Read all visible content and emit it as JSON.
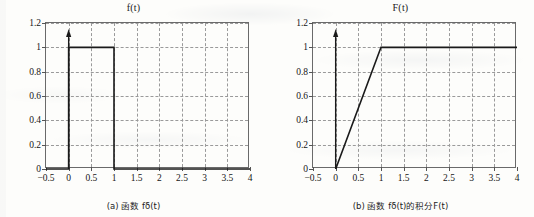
{
  "figure": {
    "background_color": "#fdfdfb",
    "axis_color": "#6a6a6a",
    "grid_color": "#9a9a9a",
    "curve_color": "#1a1a1a"
  },
  "panels": [
    {
      "id": "panel-a",
      "title": "f(t)",
      "caption_prefix": "(a)",
      "caption_cjk": "函数",
      "caption_func": "f",
      "caption_sub": "δ",
      "caption_tail": "(t)",
      "caption_full": "(a) 函数 fδ(t)",
      "xlabel": "",
      "ylabel": ""
    },
    {
      "id": "panel-b",
      "title": "F(t)",
      "caption_prefix": "(b)",
      "caption_cjk": "函数",
      "caption_func": "f",
      "caption_sub": "δ",
      "caption_mid": "(t)的积分",
      "caption_tail": "F(t)",
      "caption_full": "(b) 函数 fδ(t)的积分F(t)",
      "xlabel": "",
      "ylabel": ""
    }
  ],
  "axis": {
    "xticks": [
      "−0.5",
      "0",
      "0.5",
      "1",
      "1.5",
      "2",
      "2.5",
      "3",
      "3.5",
      "4"
    ],
    "xtick_values": [
      -0.5,
      0,
      0.5,
      1,
      1.5,
      2,
      2.5,
      3,
      3.5,
      4
    ],
    "yticks": [
      "0",
      "0.2",
      "0.4",
      "0.6",
      "0.8",
      "1",
      "1.2"
    ],
    "ytick_values": [
      0,
      0.2,
      0.4,
      0.6,
      0.8,
      1,
      1.2
    ],
    "xlim": [
      -0.5,
      4
    ],
    "ylim": [
      0,
      1.2
    ],
    "grid": "dashed"
  },
  "chart_data": [
    {
      "type": "line",
      "id": "panel-a",
      "title": "f(t)",
      "caption": "(a) 函数 fδ(t)",
      "xlabel": "",
      "ylabel": "",
      "xlim": [
        -0.5,
        4
      ],
      "ylim": [
        0,
        1.2
      ],
      "xticks": [
        -0.5,
        0,
        0.5,
        1,
        1.5,
        2,
        2.5,
        3,
        3.5,
        4
      ],
      "yticks": [
        0,
        0.2,
        0.4,
        0.6,
        0.8,
        1,
        1.2
      ],
      "grid": true,
      "legend": null,
      "series": [
        {
          "name": "f_delta(t) rectangular pulse",
          "x": [
            -0.5,
            0,
            0,
            1,
            1,
            4
          ],
          "y": [
            0,
            0,
            1,
            1,
            0,
            0
          ],
          "style": "solid",
          "color": "#1a1a1a"
        }
      ],
      "annotations": [
        {
          "type": "arrow",
          "name": "y-axis-arrow",
          "x": 0,
          "y_from": 0,
          "y_to": 1.15,
          "direction": "up"
        }
      ],
      "description": "Rectangular pulse of height 1 from t=0 to t=1, zero elsewhere"
    },
    {
      "type": "line",
      "id": "panel-b",
      "title": "F(t)",
      "caption": "(b) 函数 fδ(t)的积分F(t)",
      "xlabel": "",
      "ylabel": "",
      "xlim": [
        -0.5,
        4
      ],
      "ylim": [
        0,
        1.2
      ],
      "xticks": [
        -0.5,
        0,
        0.5,
        1,
        1.5,
        2,
        2.5,
        3,
        3.5,
        4
      ],
      "yticks": [
        0,
        0.2,
        0.4,
        0.6,
        0.8,
        1,
        1.2
      ],
      "grid": true,
      "legend": null,
      "series": [
        {
          "name": "F(t) integral ramp-saturate",
          "x": [
            0,
            1,
            4
          ],
          "y": [
            0,
            1,
            1
          ],
          "style": "solid",
          "color": "#1a1a1a"
        }
      ],
      "annotations": [
        {
          "type": "arrow",
          "name": "y-axis-arrow",
          "x": 0,
          "y_from": 0,
          "y_to": 1.15,
          "direction": "up"
        }
      ],
      "description": "Ramp rising linearly from (0,0) to (1,1), then constant at 1 through t=4"
    }
  ]
}
